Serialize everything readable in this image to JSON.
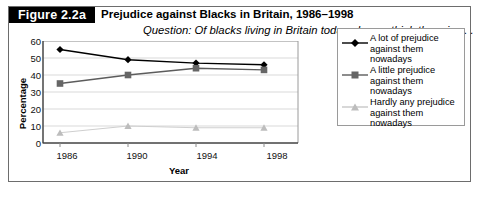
{
  "figure": {
    "tag": "Figure 2.2a",
    "title": "Prejudice against Blacks in Britain, 1986–1998",
    "subtitle": "Question: Of blacks living in Britain today, do you think there is . . ."
  },
  "chart_data": {
    "type": "line",
    "title": "Prejudice against Blacks in Britain, 1986–1998",
    "subtitle": "Question: Of blacks living in Britain today, do you think there is . . .",
    "xlabel": "Year",
    "ylabel": "Percentage",
    "categories": [
      "1986",
      "1990",
      "1994",
      "1998"
    ],
    "x": [
      1986,
      1990,
      1994,
      1998
    ],
    "xlim": [
      1985,
      2000
    ],
    "ylim": [
      0,
      60
    ],
    "yticks": [
      0,
      10,
      20,
      30,
      40,
      50,
      60
    ],
    "grid": "horizontal",
    "legend_position": "right",
    "series": [
      {
        "name": "A lot of prejudice against them nowadays",
        "marker": "diamond",
        "color": "#000000",
        "values": [
          55,
          49,
          47,
          46
        ]
      },
      {
        "name": "A little prejudice against them nowadays",
        "marker": "square",
        "color": "#666666",
        "values": [
          35,
          40,
          44,
          43
        ]
      },
      {
        "name": "Hardly any prejudice against them nowadays",
        "marker": "triangle",
        "color": "#c8c8c8",
        "values": [
          6,
          10,
          9,
          9
        ]
      }
    ]
  },
  "axes": {
    "y_ticks": [
      "60",
      "50",
      "40",
      "30",
      "20",
      "10",
      "0"
    ],
    "x_ticks": [
      "1986",
      "1990",
      "1994",
      "1998"
    ],
    "y_title": "Percentage",
    "x_title": "Year"
  },
  "legend": {
    "items": [
      {
        "label": "A lot of prejudice against them nowadays",
        "marker": "diamond-marker-icon",
        "color": "#000000"
      },
      {
        "label": "A little prejudice against them nowadays",
        "marker": "square-marker-icon",
        "color": "#666666"
      },
      {
        "label": "Hardly any prejudice against them nowadays",
        "marker": "triangle-marker-icon",
        "color": "#c8c8c8"
      }
    ]
  },
  "colors": {
    "border": "#6d6d6d",
    "tag_bg": "#000000",
    "tag_fg": "#ffffff",
    "grid": "#d9d9d9",
    "axis": "#555555"
  }
}
